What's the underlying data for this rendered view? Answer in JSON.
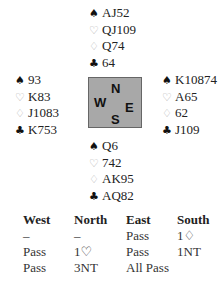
{
  "hands": {
    "north": {
      "spades": "AJ52",
      "hearts": "QJ109",
      "diamonds": "Q74",
      "clubs": "64"
    },
    "west": {
      "spades": "93",
      "hearts": "K83",
      "diamonds": "J1083",
      "clubs": "K753"
    },
    "east": {
      "spades": "K10874",
      "hearts": "A65",
      "diamonds": "62",
      "clubs": "J109"
    },
    "south": {
      "spades": "Q6",
      "hearts": "742",
      "diamonds": "AK95",
      "clubs": "AQ82"
    }
  },
  "suit_symbols": {
    "spades": "♠",
    "hearts": "♡",
    "diamonds": "♢",
    "clubs": "♣"
  },
  "compass": {
    "n": "N",
    "w": "W",
    "e": "E",
    "s": "S"
  },
  "auction": {
    "headers": [
      "West",
      "North",
      "East",
      "South"
    ],
    "rows": [
      [
        "–",
        "–",
        "Pass",
        "1♢"
      ],
      [
        "Pass",
        "1♡",
        "Pass",
        "1NT"
      ],
      [
        "Pass",
        "3NT",
        "All Pass",
        ""
      ]
    ]
  }
}
